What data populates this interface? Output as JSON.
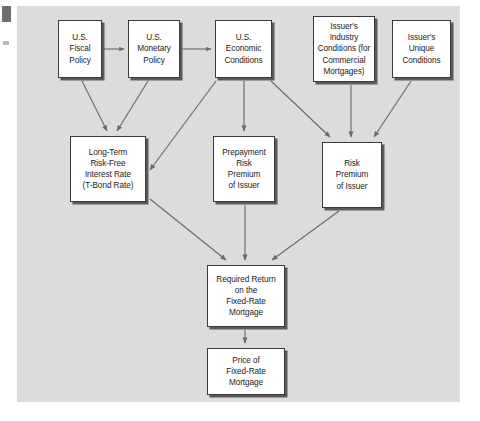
{
  "figure": {
    "background_color": "#dcdcdc",
    "page_color": "#ffffff",
    "box_fill": "#ffffff",
    "box_border_color": "#3a3a3a",
    "arrow_color": "#6b6b6b"
  },
  "nodes": {
    "fiscal_policy": "U.S.\nFiscal\nPolicy",
    "monetary_policy": "U.S.\nMonetary\nPolicy",
    "economic_conditions": "U.S.\nEconomic\nConditions",
    "industry_conditions": "Issuer's\nIndustry\nConditions (for\nCommercial\nMortgages)",
    "unique_conditions": "Issuer's\nUnique\nConditions",
    "long_term_rate": "Long-Term\nRisk-Free\nInterest Rate\n(T-Bond Rate)",
    "prepayment_risk_premium": "Prepayment\nRisk\nPremium\nof Issuer",
    "risk_premium": "Risk\nPremium\nof Issuer",
    "required_return": "Required Return\non the\nFixed-Rate\nMortgage",
    "price": "Price of\nFixed-Rate\nMortgage"
  },
  "edges": [
    {
      "from": "fiscal_policy",
      "to": "monetary_policy",
      "style": "bidirectional"
    },
    {
      "from": "monetary_policy",
      "to": "economic_conditions",
      "style": "bidirectional"
    },
    {
      "from": "fiscal_policy",
      "to": "long_term_rate",
      "style": "directed"
    },
    {
      "from": "monetary_policy",
      "to": "long_term_rate",
      "style": "directed"
    },
    {
      "from": "economic_conditions",
      "to": "long_term_rate",
      "style": "directed"
    },
    {
      "from": "economic_conditions",
      "to": "prepayment_risk_premium",
      "style": "directed"
    },
    {
      "from": "economic_conditions",
      "to": "risk_premium",
      "style": "directed"
    },
    {
      "from": "industry_conditions",
      "to": "risk_premium",
      "style": "directed"
    },
    {
      "from": "unique_conditions",
      "to": "risk_premium",
      "style": "directed"
    },
    {
      "from": "long_term_rate",
      "to": "required_return",
      "style": "directed"
    },
    {
      "from": "prepayment_risk_premium",
      "to": "required_return",
      "style": "directed"
    },
    {
      "from": "risk_premium",
      "to": "required_return",
      "style": "directed"
    },
    {
      "from": "required_return",
      "to": "price",
      "style": "directed"
    }
  ]
}
